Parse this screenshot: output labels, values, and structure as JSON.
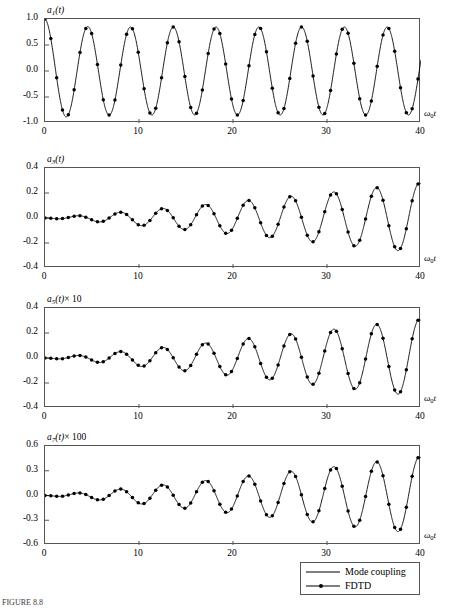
{
  "figure": {
    "caption": "FIGURE 8.8",
    "legend": {
      "entries": [
        {
          "label": "Mode coupling",
          "style": "line",
          "color": "#000000"
        },
        {
          "label": "FDTD",
          "style": "line-marker",
          "color": "#000000"
        }
      ]
    }
  },
  "chart_data": [
    {
      "type": "line",
      "title": "",
      "ylabel": "a_1(t)",
      "ylabel_parts": {
        "base": "a",
        "sub": "1",
        "rest": "(t)",
        "scale": ""
      },
      "xlabel": "ω₀t",
      "xlim": [
        0,
        40
      ],
      "ylim": [
        -1.0,
        1.0
      ],
      "xticks": [
        0,
        10,
        20,
        30,
        40
      ],
      "yticks": [
        1.0,
        0.5,
        0.0,
        -0.5,
        -1.0
      ],
      "ytick_labels": [
        "1.0",
        "0.5",
        "0.0",
        "-0.5",
        "-1.0"
      ],
      "xtick_labels": [
        "0",
        "10",
        "20",
        "30",
        "40"
      ],
      "grid": false,
      "legend_position": "below-figure",
      "series": [
        {
          "name": "Mode coupling",
          "style": "line",
          "model": "damped_cosine",
          "amplitude": 1.0,
          "period": 4.55,
          "decay_to": 0.82,
          "phase": 0.0
        },
        {
          "name": "FDTD",
          "style": "line-marker",
          "sample_step": 0.62,
          "model": "damped_cosine",
          "amplitude": 1.0,
          "period": 4.55,
          "decay_to": 0.82,
          "phase": 0.0
        }
      ]
    },
    {
      "type": "line",
      "title": "",
      "ylabel": "a_3(t)",
      "ylabel_parts": {
        "base": "a",
        "sub": "3",
        "rest": "(t)",
        "scale": ""
      },
      "xlabel": "ω₀t",
      "xlim": [
        0,
        40
      ],
      "ylim": [
        -0.4,
        0.4
      ],
      "xticks": [
        0,
        10,
        20,
        30,
        40
      ],
      "yticks": [
        0.4,
        0.2,
        0.0,
        -0.2,
        -0.4
      ],
      "ytick_labels": [
        "0.4",
        "0.2",
        "0.0",
        "-0.2",
        "-0.4"
      ],
      "xtick_labels": [
        "0",
        "10",
        "20",
        "30",
        "40"
      ],
      "grid": false,
      "series": [
        {
          "name": "Mode coupling",
          "style": "line",
          "model": "growing_sine",
          "envelope_start": 0.0,
          "envelope_end": 0.28,
          "period": 4.55,
          "phase": 3.14159
        },
        {
          "name": "FDTD",
          "style": "line-marker",
          "sample_step": 0.62,
          "model": "growing_sine",
          "envelope_start": 0.0,
          "envelope_end": 0.28,
          "period": 4.55,
          "phase": 3.14159
        }
      ]
    },
    {
      "type": "line",
      "title": "",
      "ylabel": "a_5(t) × 10",
      "ylabel_parts": {
        "base": "a",
        "sub": "5",
        "rest": "(t)",
        "scale": "× 10"
      },
      "xlabel": "ω₀t",
      "xlim": [
        0,
        40
      ],
      "ylim": [
        -0.4,
        0.4
      ],
      "xticks": [
        0,
        10,
        20,
        30,
        40
      ],
      "yticks": [
        0.4,
        0.2,
        0.0,
        -0.2,
        -0.4
      ],
      "ytick_labels": [
        "0.4",
        "0.2",
        "0.0",
        "-0.2",
        "-0.4"
      ],
      "xtick_labels": [
        "0",
        "10",
        "20",
        "30",
        "40"
      ],
      "grid": false,
      "series": [
        {
          "name": "Mode coupling",
          "style": "line",
          "model": "growing_sine",
          "envelope_start": 0.0,
          "envelope_end": 0.31,
          "period": 4.55,
          "phase": 3.14159
        },
        {
          "name": "FDTD",
          "style": "line-marker",
          "sample_step": 0.62,
          "model": "growing_sine",
          "envelope_start": 0.0,
          "envelope_end": 0.31,
          "period": 4.55,
          "phase": 3.14159
        }
      ]
    },
    {
      "type": "line",
      "title": "",
      "ylabel": "a_7(t) × 100",
      "ylabel_parts": {
        "base": "a",
        "sub": "7",
        "rest": "(t)",
        "scale": "× 100"
      },
      "xlabel": "ω₀t",
      "xlim": [
        0,
        40
      ],
      "ylim": [
        -0.6,
        0.6
      ],
      "xticks": [
        0,
        10,
        20,
        30,
        40
      ],
      "yticks": [
        0.6,
        0.3,
        0.0,
        -0.3,
        -0.6
      ],
      "ytick_labels": [
        "0.6",
        "0.3",
        "0.0",
        "-0.3",
        "-0.6"
      ],
      "xtick_labels": [
        "0",
        "10",
        "20",
        "30",
        "40"
      ],
      "grid": false,
      "series": [
        {
          "name": "Mode coupling",
          "style": "line",
          "model": "growing_sine",
          "envelope_start": 0.0,
          "envelope_end": 0.47,
          "period": 4.55,
          "phase": 3.14159
        },
        {
          "name": "FDTD",
          "style": "line-marker",
          "sample_step": 0.62,
          "model": "growing_sine",
          "envelope_start": 0.0,
          "envelope_end": 0.47,
          "period": 4.55,
          "phase": 3.14159
        }
      ]
    }
  ]
}
